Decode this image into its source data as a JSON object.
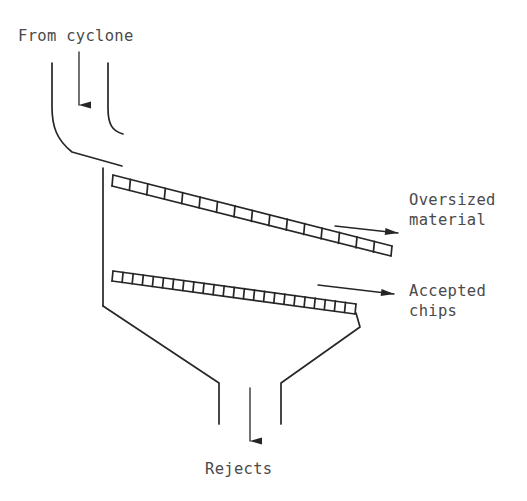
{
  "diagram": {
    "stroke_color": "#262626",
    "text_color": "#4a4a4a",
    "background_color": "#ffffff",
    "labels": {
      "inlet": "From cyclone",
      "oversized_line1": "Oversized",
      "oversized_line2": "material",
      "accepted_line1": "Accepted",
      "accepted_line2": "chips",
      "rejects": "Rejects"
    },
    "components": [
      {
        "name": "inlet-chute",
        "description": "Curved feed chute entering the screen from the cyclone above"
      },
      {
        "name": "upper-screen-deck",
        "description": "Coarse inclined screen deck that retains oversized material",
        "segments": 16,
        "incline": "downward to the right"
      },
      {
        "name": "lower-screen-deck",
        "description": "Fine inclined screen deck that passes accepted chips",
        "segments": 24,
        "incline": "downward to the right"
      },
      {
        "name": "reject-hopper",
        "description": "Converging funnel collecting rejects at the bottom outlet"
      }
    ],
    "flow_arrows": [
      {
        "name": "inlet-arrow",
        "direction": "down",
        "label": "From cyclone"
      },
      {
        "name": "oversized-arrow",
        "direction": "right",
        "label": "Oversized material"
      },
      {
        "name": "accepted-arrow",
        "direction": "right",
        "label": "Accepted chips"
      },
      {
        "name": "rejects-arrow",
        "direction": "down",
        "label": "Rejects"
      }
    ]
  }
}
